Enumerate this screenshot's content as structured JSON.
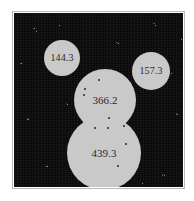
{
  "figure": {
    "panel": {
      "background_color": "#090909",
      "region_color": "#c9c9c9",
      "label_color": "#2a2a2a",
      "frame_color": "#b9b9b9"
    }
  },
  "regions": [
    {
      "id": "region-144",
      "label": "144.3",
      "shape": "circle",
      "cx": 48,
      "cy": 45,
      "r": 18
    },
    {
      "id": "region-157",
      "label": "157.3",
      "shape": "circle",
      "cx": 137,
      "cy": 58,
      "r": 19
    },
    {
      "id": "region-366",
      "label": "366.2",
      "shape": "circle",
      "cx": 91,
      "cy": 87,
      "r": 31
    },
    {
      "id": "region-439",
      "label": "439.3",
      "shape": "circle",
      "cx": 90,
      "cy": 140,
      "r": 37
    }
  ],
  "sources": [
    {
      "id": "source-1",
      "x": 84,
      "y": 66
    },
    {
      "id": "source-2",
      "x": 70,
      "y": 75
    },
    {
      "id": "source-3",
      "x": 69,
      "y": 81
    },
    {
      "id": "source-4",
      "x": 94,
      "y": 104
    },
    {
      "id": "source-5",
      "x": 80,
      "y": 114
    },
    {
      "id": "source-6",
      "x": 93,
      "y": 114
    },
    {
      "id": "source-7",
      "x": 109,
      "y": 112
    },
    {
      "id": "source-8",
      "x": 111,
      "y": 130
    },
    {
      "id": "source-9",
      "x": 103,
      "y": 152
    }
  ],
  "stars": [
    {
      "x": 22,
      "y": 18
    },
    {
      "x": 141,
      "y": 12
    },
    {
      "x": 104,
      "y": 30
    },
    {
      "x": 157,
      "y": 60
    },
    {
      "x": 53,
      "y": 91
    },
    {
      "x": 14,
      "y": 106
    },
    {
      "x": 163,
      "y": 101
    },
    {
      "x": 123,
      "y": 134
    },
    {
      "x": 33,
      "y": 153
    },
    {
      "x": 150,
      "y": 162
    },
    {
      "x": 77,
      "y": 166
    },
    {
      "x": 7,
      "y": 50
    },
    {
      "x": 167,
      "y": 26
    },
    {
      "x": 45,
      "y": 12
    },
    {
      "x": 128,
      "y": 170
    }
  ]
}
